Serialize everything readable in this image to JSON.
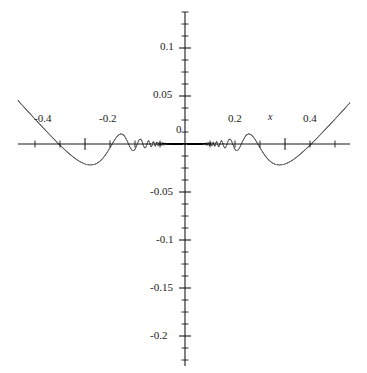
{
  "chart_data": {
    "type": "line",
    "title": "",
    "subtitle": "",
    "xlabel": "x",
    "ylabel": "",
    "xlim": [
      -0.53,
      0.53
    ],
    "ylim": [
      -0.232,
      0.136
    ],
    "grid": false,
    "legend": null,
    "curve_color": "#4a4a4a",
    "axis_color": "#1a1a1a",
    "background": "#ffffff",
    "x_ticks_major": [
      -0.4,
      -0.2,
      0.2,
      0.4
    ],
    "x_tick_labels": [
      "-0.4",
      "-0.2",
      "0.2",
      "0.4"
    ],
    "x_ticks_minor_step": 0.05,
    "y_ticks_major": [
      0.1,
      0.05,
      -0.05,
      -0.1,
      -0.15,
      -0.2
    ],
    "y_tick_labels": [
      "0.1",
      "0.05",
      "-0.05",
      "-0.1",
      "-0.15",
      "-0.2"
    ],
    "y_ticks_minor_step": 0.0125,
    "origin_label": "0",
    "envelope": {
      "form": "amplitude proportional to x^2 scaled",
      "peak_positive_max": 0.128,
      "peak_negative_min": -0.228
    },
    "notable_extrema": [
      {
        "x": -0.472,
        "y": -0.228
      },
      {
        "x": -0.399,
        "y": 0.128
      },
      {
        "x": -0.33,
        "y": -0.09
      },
      {
        "x": -0.284,
        "y": 0.072
      },
      {
        "x": -0.25,
        "y": -0.058
      },
      {
        "x": -0.224,
        "y": 0.048
      },
      {
        "x": -0.205,
        "y": -0.04
      },
      {
        "x": 0.205,
        "y": -0.04
      },
      {
        "x": 0.224,
        "y": 0.048
      },
      {
        "x": 0.25,
        "y": -0.058
      },
      {
        "x": 0.284,
        "y": 0.072
      },
      {
        "x": 0.33,
        "y": -0.09
      },
      {
        "x": 0.399,
        "y": 0.128
      },
      {
        "x": 0.472,
        "y": -0.228
      }
    ],
    "series": [
      {
        "name": "f(x)",
        "color": "#4a4a4a",
        "line_width": 0.9,
        "formula": "0.65*x^2*cos(0.1/x^2)"
      }
    ]
  },
  "labels": {
    "x_neg_04": "-0.4",
    "x_neg_02": "-0.2",
    "x_pos_02": "0.2",
    "x_pos_04": "0.4",
    "origin": "0",
    "y_01": "0.1",
    "y_005": "0.05",
    "y_neg_005": "-0.05",
    "y_neg_01": "-0.1",
    "y_neg_015": "-0.15",
    "y_neg_02": "-0.2",
    "axis_x_name": "x"
  }
}
